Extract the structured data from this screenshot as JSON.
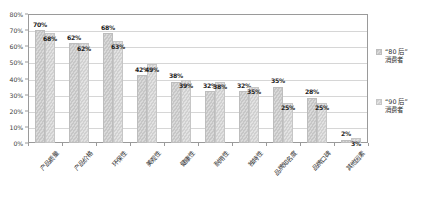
{
  "chart_data": {
    "type": "bar",
    "title": "",
    "subtitle": "",
    "xlabel": "",
    "ylabel": "",
    "ylim": [
      0,
      80
    ],
    "ytick_labels": [
      "0%",
      "10%",
      "20%",
      "30%",
      "40%",
      "50%",
      "60%",
      "70%",
      "80%"
    ],
    "ytick_values": [
      0,
      10,
      20,
      30,
      40,
      50,
      60,
      70,
      80
    ],
    "grid": true,
    "legend_position": "right",
    "categories": [
      "产品质量",
      "产品价格",
      "环保性",
      "美观性",
      "健康性",
      "耐用性",
      "独特性",
      "品牌知名度",
      "品牌口碑",
      "其他因素"
    ],
    "series": [
      {
        "name": "“80后”消费者",
        "legend_label": "“80 后”\n消费者",
        "color": "#c9c9c9",
        "values": [
          70,
          62,
          68,
          42,
          38,
          32,
          32,
          35,
          28,
          2
        ],
        "value_labels": [
          "70%",
          "62%",
          "68%",
          "42%",
          "38%",
          "32%",
          "32%",
          "35%",
          "28%",
          "2%"
        ]
      },
      {
        "name": "“90后”消费者",
        "legend_label": "“90 后”\n消费者",
        "color": "#dcdcdc",
        "values": [
          68,
          62,
          63,
          49,
          39,
          38,
          35,
          25,
          25,
          3
        ],
        "value_labels": [
          "68%",
          "62%",
          "63%",
          "49%",
          "39%",
          "38%",
          "35%",
          "25%",
          "25%",
          "3%"
        ]
      }
    ]
  }
}
